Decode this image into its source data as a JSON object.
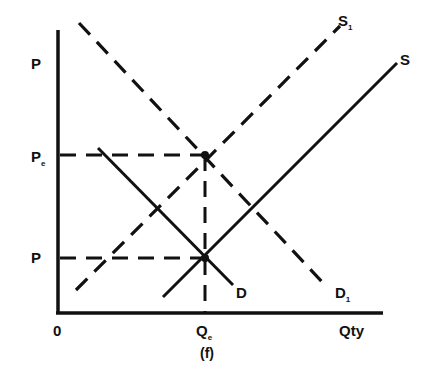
{
  "figure": {
    "caption": "(f)",
    "axes": {
      "y_label_top": "P",
      "x_label_right": "Qty",
      "origin_label": "0"
    },
    "tick_labels": {
      "pe": {
        "main": "P",
        "sub": "e"
      },
      "p": {
        "main": "P"
      },
      "qe": {
        "main": "Q",
        "sub": "e"
      }
    },
    "curves": [
      {
        "id": "D1",
        "label": "D",
        "sub": "1",
        "style": "dashed"
      },
      {
        "id": "S1",
        "label": "S",
        "sub": "1",
        "style": "dashed"
      },
      {
        "id": "D",
        "label": "D",
        "style": "solid"
      },
      {
        "id": "S",
        "label": "S",
        "style": "solid"
      }
    ],
    "colors": {
      "ink": "#111111",
      "background": "#ffffff"
    }
  }
}
